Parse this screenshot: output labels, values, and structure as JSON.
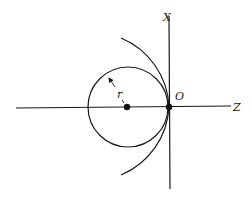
{
  "diagram": {
    "labels": {
      "x_axis": "X",
      "z_axis": "Z",
      "origin": "O",
      "radius": "r"
    },
    "colors": {
      "stroke": "#1a1a1a",
      "background": "#ffffff"
    },
    "elements": [
      "horizontal Z axis",
      "vertical X axis",
      "circle of radius r tangent to X axis at O",
      "larger arc tangent to X axis at O",
      "center dot",
      "origin dot",
      "radius arrow labeled r"
    ]
  }
}
